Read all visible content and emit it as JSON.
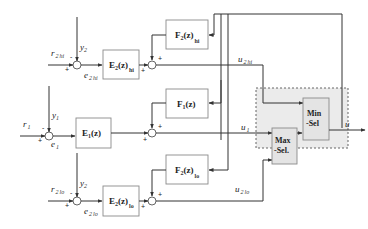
{
  "diagram": {
    "type": "control block diagram (override / selector control)",
    "blocks": {
      "e2_hi": {
        "main": "E",
        "sub": "2",
        "arg": "(z)",
        "suffix": "hi"
      },
      "f2_hi": {
        "main": "F",
        "sub": "2",
        "arg": "(z)",
        "suffix": "hi"
      },
      "e1": {
        "main": "E",
        "sub": "1",
        "arg": "(z)"
      },
      "f1": {
        "main": "F",
        "sub": "1",
        "arg": "(z)"
      },
      "e2_lo": {
        "main": "E",
        "sub": "2",
        "arg": "(z)",
        "suffix": "lo"
      },
      "f2_lo": {
        "main": "F",
        "sub": "2",
        "arg": "(z)",
        "suffix": "lo"
      },
      "max_sel": {
        "line1": "Max",
        "line2": "-Sel."
      },
      "min_sel": {
        "line1": "Min",
        "line2": "-Sel"
      }
    },
    "signals": {
      "r2_hi": {
        "main": "r",
        "sub": "2",
        "suffix": "hi"
      },
      "y2_top": {
        "main": "y",
        "sub": "2"
      },
      "e2_hi": {
        "main": "e",
        "sub": "2",
        "suffix": "hi"
      },
      "u2_hi": {
        "main": "u",
        "sub": "2",
        "suffix": "hi"
      },
      "r1": {
        "main": "r",
        "sub": "1"
      },
      "y1": {
        "main": "y",
        "sub": "1"
      },
      "e1": {
        "main": "e",
        "sub": "1"
      },
      "u1": {
        "main": "u",
        "sub": "1"
      },
      "r2_lo": {
        "main": "r",
        "sub": "2",
        "suffix": "lo"
      },
      "y2_bot": {
        "main": "y",
        "sub": "2"
      },
      "e2_lo": {
        "main": "e",
        "sub": "2",
        "suffix": "lo"
      },
      "u2_lo": {
        "main": "u",
        "sub": "2",
        "suffix": "lo"
      },
      "u": {
        "main": "u"
      }
    },
    "signs": {
      "plus": "+",
      "minus": "-"
    }
  }
}
